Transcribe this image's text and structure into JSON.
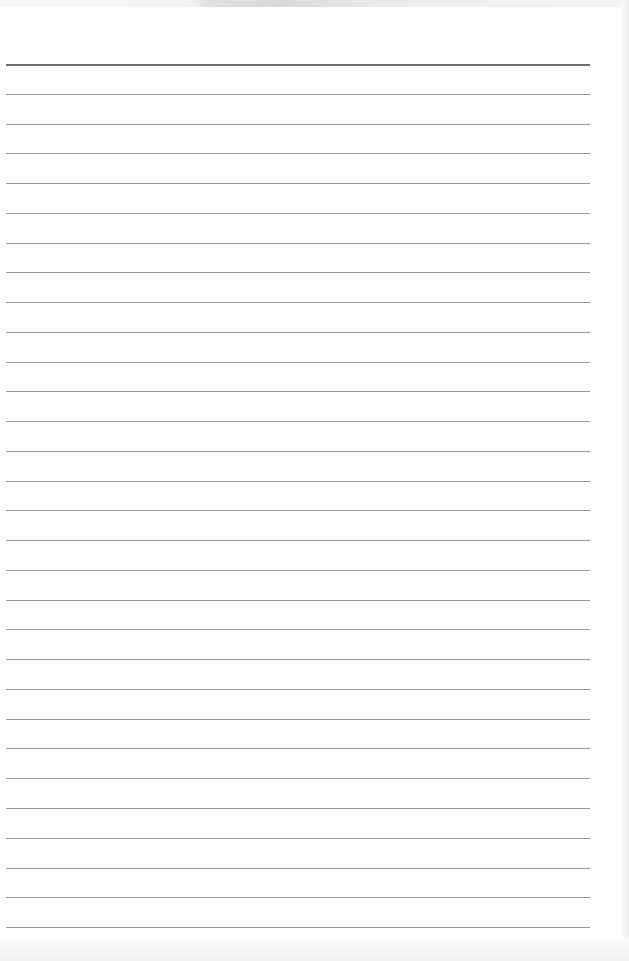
{
  "page": {
    "type": "ruled-paper",
    "background_color": "#fefefe",
    "rule_color": "#9a9a9a",
    "header_rule_color": "#6e6e6e",
    "rule_count": 30,
    "first_rule_y": 64,
    "rule_spacing": 29.76,
    "rule_left_x": 6,
    "rule_right_x": 590
  },
  "content": {
    "text": ""
  }
}
